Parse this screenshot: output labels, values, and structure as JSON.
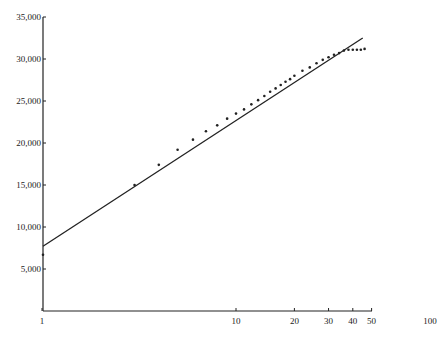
{
  "chart_data": {
    "type": "scatter",
    "title": "",
    "xlabel": "",
    "ylabel": "",
    "x_scale": "log",
    "x_ticks": [
      1,
      10,
      20,
      30,
      40,
      50,
      100
    ],
    "x_tick_labels": [
      "1",
      "10",
      "20",
      "30",
      "40",
      "50",
      "100"
    ],
    "y_ticks": [
      5000,
      10000,
      15000,
      20000,
      25000,
      30000,
      35000
    ],
    "y_tick_labels": [
      "5,000",
      "10,000",
      "15,000",
      "20,000",
      "25,000",
      "30,000",
      "35,000"
    ],
    "xlim": [
      1,
      100
    ],
    "ylim": [
      0,
      35000
    ],
    "grid": false,
    "legend": null,
    "series": [
      {
        "name": "observed",
        "kind": "points",
        "x": [
          1,
          3,
          4,
          5,
          6,
          7,
          8,
          9,
          10,
          11,
          12,
          13,
          14,
          15,
          16,
          17,
          18,
          19,
          20,
          22,
          24,
          26,
          28,
          30,
          32,
          34,
          36,
          38,
          40,
          42,
          44,
          46
        ],
        "y": [
          6700,
          15000,
          17400,
          19200,
          20400,
          21400,
          22100,
          22900,
          23500,
          24000,
          24600,
          25100,
          25600,
          26100,
          26500,
          26900,
          27300,
          27600,
          28000,
          28600,
          29000,
          29500,
          29900,
          30200,
          30500,
          30700,
          31000,
          31100,
          31100,
          31100,
          31100,
          31200
        ]
      },
      {
        "name": "fitted trend",
        "kind": "line",
        "x": [
          1,
          45
        ],
        "y": [
          7700,
          32500
        ]
      }
    ]
  },
  "colors": {
    "ink": "#222222",
    "background": "#ffffff"
  }
}
